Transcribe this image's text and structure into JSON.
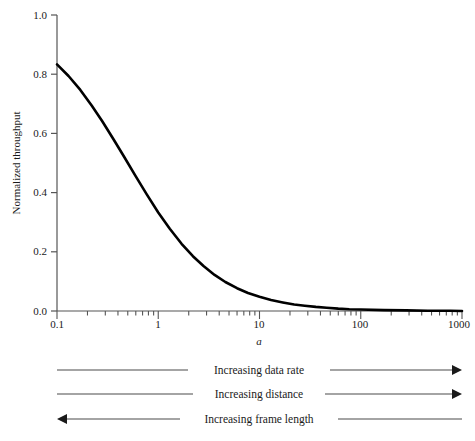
{
  "chart_data": {
    "type": "line",
    "title": "",
    "subtitle": "",
    "xlabel": "a",
    "ylabel": "Normalized throughput",
    "xscale": "log",
    "yscale": "linear",
    "xlim": [
      0.1,
      1000
    ],
    "ylim": [
      0.0,
      1.0
    ],
    "grid": false,
    "legend": null,
    "x_ticks": [
      "0.1",
      "1",
      "10",
      "100",
      "1000"
    ],
    "x_tick_values": [
      0.1,
      1,
      10,
      100,
      1000
    ],
    "y_ticks": [
      "0.0",
      "0.2",
      "0.4",
      "0.6",
      "0.8",
      "1.0"
    ],
    "y_tick_values": [
      0.0,
      0.2,
      0.4,
      0.6,
      0.8,
      1.0
    ],
    "series": [
      {
        "name": "Normalized throughput",
        "color": "#000000",
        "x": [
          0.1,
          0.13,
          0.17,
          0.22,
          0.28,
          0.36,
          0.46,
          0.6,
          0.77,
          1.0,
          1.3,
          1.7,
          2.2,
          2.8,
          3.6,
          4.6,
          6.0,
          7.7,
          10.0,
          13.0,
          17.0,
          22.0,
          28.0,
          36.0,
          46.0,
          60.0,
          77.0,
          100.0,
          170.0,
          280.0,
          460.0,
          770.0,
          1000.0
        ],
        "y": [
          0.833,
          0.794,
          0.747,
          0.694,
          0.641,
          0.581,
          0.521,
          0.455,
          0.394,
          0.333,
          0.278,
          0.227,
          0.185,
          0.152,
          0.122,
          0.098,
          0.077,
          0.061,
          0.048,
          0.037,
          0.029,
          0.022,
          0.018,
          0.014,
          0.011,
          0.008,
          0.006,
          0.005,
          0.003,
          0.002,
          0.001,
          0.001,
          0.0
        ]
      }
    ],
    "annotations": [
      {
        "text": "Increasing data rate",
        "direction": "right"
      },
      {
        "text": "Increasing distance",
        "direction": "right"
      },
      {
        "text": "Increasing frame length",
        "direction": "left"
      }
    ]
  },
  "axes": {
    "y_label": "Normalized throughput",
    "x_label": "a",
    "y_tick_labels": {
      "t0": "0.0",
      "t1": "0.2",
      "t2": "0.4",
      "t3": "0.6",
      "t4": "0.8",
      "t5": "1.0"
    },
    "x_tick_labels": {
      "t0": "0.1",
      "t1": "1",
      "t2": "10",
      "t3": "100",
      "t4": "1000"
    }
  },
  "annotations": {
    "row1": "Increasing data rate",
    "row2": "Increasing distance",
    "row3": "Increasing frame length"
  },
  "colors": {
    "curve": "#000000",
    "axis": "#555555",
    "text": "#1a1a1a",
    "annotation_line": "#4a4a4a",
    "background": "#ffffff"
  }
}
